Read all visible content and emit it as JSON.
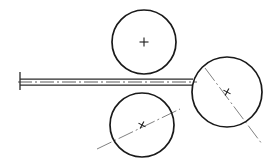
{
  "figure": {
    "type": "technical-line-drawing",
    "canvas": {
      "width": 278,
      "height": 166,
      "background": "#ffffff"
    },
    "stroke_colors": {
      "outline": "#1a1a1a",
      "shaft_edge": "#2a2a2a",
      "centerline": "#4a4a4a",
      "centerline_thin": "#6a6a6a"
    }
  },
  "circles": [
    {
      "id": "top-roller",
      "label": "Top roller",
      "cx": 144,
      "cy": 42,
      "r": 32,
      "center_mark": "plus",
      "center_mark_size": 9,
      "center_mark_rotation": 0
    },
    {
      "id": "bottom-roller",
      "label": "Bottom roller",
      "cx": 142,
      "cy": 125,
      "r": 32,
      "center_mark": "cross",
      "center_mark_size": 8,
      "center_mark_rotation": 28
    },
    {
      "id": "right-roller",
      "label": "Right roller",
      "cx": 227,
      "cy": 92,
      "r": 35,
      "center_mark": "cross",
      "center_mark_size": 8,
      "center_mark_rotation": 28
    }
  ],
  "shaft": {
    "id": "horizontal-shaft",
    "label": "Horizontal shaft",
    "x_start": 20,
    "x_end": 193,
    "top_edge_y": 79,
    "bottom_edge_y": 85,
    "axis_y": 82,
    "endcap": {
      "x": 20,
      "y_top": 72,
      "y_bottom": 90
    }
  },
  "diagonal_centerlines": [
    {
      "id": "bottom-roller-axis",
      "label": "Bottom roller axis",
      "x1": 97,
      "y1": 149,
      "x2": 180,
      "y2": 109
    },
    {
      "id": "right-roller-axis",
      "label": "Right roller axis",
      "x1": 205,
      "y1": 68,
      "x2": 262,
      "y2": 144
    }
  ],
  "dash_patterns": {
    "shaft_axis": "14 3 2 3",
    "roller_axis": "16 3 2 3"
  }
}
